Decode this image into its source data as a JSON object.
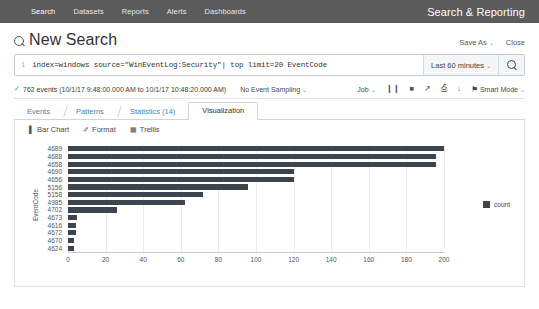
{
  "navbar": {
    "items": [
      {
        "label": "Search",
        "active": true
      },
      {
        "label": "Datasets",
        "active": false
      },
      {
        "label": "Reports",
        "active": false
      },
      {
        "label": "Alerts",
        "active": false
      },
      {
        "label": "Dashboards",
        "active": false
      }
    ],
    "app_name": "Search & Reporting"
  },
  "header": {
    "title": "New Search",
    "save_as": "Save As",
    "close": "Close",
    "caret": "⌄"
  },
  "search": {
    "line_number": "1",
    "query": "index=windows source=\"WinEventLog:Security\"| top limit=20 EventCode",
    "time_range": "Last 60 minutes"
  },
  "status": {
    "check": "✓",
    "events": "762 events (10/1/17 9:48:00.000 AM to 10/1/17 10:48:20.000 AM)",
    "sampling": "No Event Sampling",
    "job": "Job",
    "pause": "❙❙",
    "stop": "■",
    "share": "↗",
    "print": "⎙",
    "export": "↓",
    "mode": "Smart Mode",
    "bolt": "⚑"
  },
  "tabs": [
    {
      "label": "Events",
      "active": false
    },
    {
      "label": "Patterns",
      "active": false
    },
    {
      "label": "Statistics (14)",
      "active": false
    },
    {
      "label": "Visualization",
      "active": true
    }
  ],
  "chart_toolbar": [
    {
      "label": "Bar Chart",
      "icon": "▌"
    },
    {
      "label": "Format",
      "icon": "✐"
    },
    {
      "label": "Trellis",
      "icon": "▦"
    }
  ],
  "chart_data": {
    "type": "bar",
    "orientation": "horizontal",
    "title": "",
    "xlabel": "",
    "ylabel": "EventCode",
    "xlim": [
      0,
      200
    ],
    "xticks": [
      0,
      20,
      40,
      60,
      80,
      100,
      120,
      140,
      160,
      180,
      200
    ],
    "grid": true,
    "legend": "count",
    "legend_position": "right",
    "series_name": "count",
    "bar_color": "#3c444d",
    "categories": [
      "4689",
      "4688",
      "4658",
      "4690",
      "4656",
      "5156",
      "5158",
      "4985",
      "4702",
      "4673",
      "4616",
      "4672",
      "4670",
      "4624"
    ],
    "values": [
      204,
      196,
      196,
      120,
      120,
      96,
      72,
      62,
      26,
      5,
      4,
      4,
      3,
      3
    ]
  }
}
